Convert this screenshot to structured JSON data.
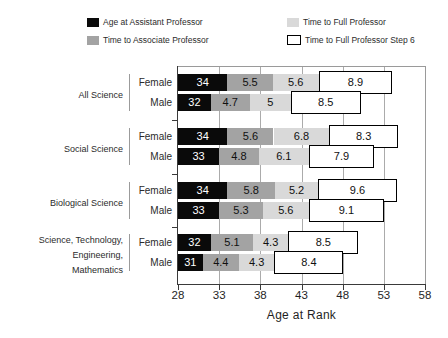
{
  "legend": {
    "items": [
      {
        "label": "Age at Assistant Professor",
        "swatch": "black-square",
        "color": "#0a0a0a"
      },
      {
        "label": "Time to Associate Professor",
        "swatch": "gray-square",
        "color": "#a3a3a3"
      },
      {
        "label": "Time to Full Professor",
        "swatch": "lightgray-square",
        "color": "#d9d9d9"
      },
      {
        "label": "Time to Full Professor Step 6",
        "swatch": "white-outlined-square",
        "color": "#ffffff"
      }
    ]
  },
  "colors": {
    "segment_black": "#0a0a0a",
    "segment_gray": "#a3a3a3",
    "segment_lightgray": "#d9d9d9",
    "step6_fill": "#ffffff",
    "step6_border": "#000000",
    "gridline": "#ababab",
    "frame": "#9a9a9a",
    "axis": "#3a3a3a",
    "text": "#2b2b2b"
  },
  "chart_data": {
    "type": "bar",
    "orientation": "horizontal",
    "stacked": true,
    "title": "",
    "xlabel": "Age at Rank",
    "xlim": [
      28,
      58
    ],
    "x_ticks": [
      "28",
      "33",
      "38",
      "43",
      "48",
      "53",
      "58"
    ],
    "grid": true,
    "legend_position": "top",
    "series_names": [
      "Age at Assistant Professor",
      "Time to Associate Professor",
      "Time to Full Professor",
      "Time to Full Professor Step 6"
    ],
    "groups": [
      {
        "label_lines": [
          "All Science"
        ],
        "rows": [
          {
            "sex": "Female",
            "values": [
              34,
              5.5,
              5.6,
              8.9
            ],
            "value_labels": [
              "34",
              "5.5",
              "5.6",
              "8.9"
            ]
          },
          {
            "sex": "Male",
            "values": [
              32,
              4.7,
              5,
              8.5
            ],
            "value_labels": [
              "32",
              "4.7",
              "5",
              "8.5"
            ]
          }
        ]
      },
      {
        "label_lines": [
          "Social Science"
        ],
        "rows": [
          {
            "sex": "Female",
            "values": [
              34,
              5.6,
              6.8,
              8.3
            ],
            "value_labels": [
              "34",
              "5.6",
              "6.8",
              "8.3"
            ]
          },
          {
            "sex": "Male",
            "values": [
              33,
              4.8,
              6.1,
              7.9
            ],
            "value_labels": [
              "33",
              "4.8",
              "6.1",
              "7.9"
            ]
          }
        ]
      },
      {
        "label_lines": [
          "Biological Science"
        ],
        "rows": [
          {
            "sex": "Female",
            "values": [
              34,
              5.8,
              5.2,
              9.6
            ],
            "value_labels": [
              "34",
              "5.8",
              "5.2",
              "9.6"
            ]
          },
          {
            "sex": "Male",
            "values": [
              33,
              5.3,
              5.6,
              9.1
            ],
            "value_labels": [
              "33",
              "5.3",
              "5.6",
              "9.1"
            ]
          }
        ]
      },
      {
        "label_lines": [
          "Science, Technology,",
          "Engineering,",
          "Mathematics"
        ],
        "rows": [
          {
            "sex": "Female",
            "values": [
              32,
              5.1,
              4.3,
              8.5
            ],
            "value_labels": [
              "32",
              "5.1",
              "4.3",
              "8.5"
            ]
          },
          {
            "sex": "Male",
            "values": [
              31,
              4.4,
              4.3,
              8.4
            ],
            "value_labels": [
              "31",
              "4.4",
              "4.3",
              "8.4"
            ]
          }
        ]
      }
    ]
  }
}
